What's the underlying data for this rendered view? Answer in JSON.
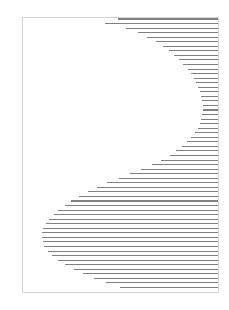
{
  "canvas": {
    "width": 229,
    "height": 310,
    "background": "#ffffff",
    "title": "Scanline S-Curve Line Art"
  },
  "frame": {
    "name": "page-border",
    "x": 22.5,
    "y": 17.5,
    "width": 196,
    "height": 275,
    "stroke": "#c9c9c9",
    "stroke_width": 0.8,
    "fill": "none"
  },
  "hatching": {
    "name": "horizontal-scanline-hatching",
    "stroke": "#808080",
    "stroke_width": 1.05,
    "right_edge_x": 218,
    "line_spacing": 4.55,
    "first_line_y": 19,
    "line_count": 60,
    "description": "Horizontal rules clipped to an S / comma shaped region; each rule starts at the curve's left boundary and runs to the right edge of the frame.",
    "left_edges": [
      118,
      104,
      122,
      134,
      143,
      151,
      158,
      164,
      169,
      174,
      178,
      182,
      186,
      189,
      192,
      194,
      196,
      198,
      200,
      201,
      202,
      203,
      203,
      203,
      202,
      201,
      200,
      198,
      196,
      193,
      190,
      186,
      181,
      176,
      170,
      163,
      155,
      146,
      136,
      126,
      116,
      106,
      97,
      89,
      81,
      74,
      68,
      62,
      57,
      53,
      49,
      46,
      44,
      42,
      42,
      42,
      43,
      45,
      48,
      52,
      57,
      63,
      70,
      78,
      87,
      97,
      108,
      120
    ]
  },
  "accent_colors": {
    "line": "#808080",
    "border": "#c9c9c9",
    "paper": "#ffffff"
  }
}
